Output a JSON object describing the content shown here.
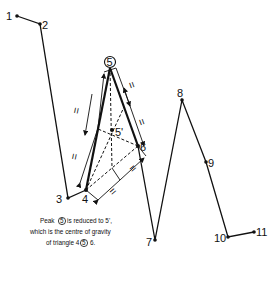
{
  "diagram": {
    "points": [
      {
        "id": "1",
        "label": "1"
      },
      {
        "id": "2",
        "label": "2"
      },
      {
        "id": "3",
        "label": "3"
      },
      {
        "id": "4",
        "label": "4"
      },
      {
        "id": "5",
        "label": "5",
        "circled": true
      },
      {
        "id": "5p",
        "label": "5'"
      },
      {
        "id": "6",
        "label": "6"
      },
      {
        "id": "7",
        "label": "7"
      },
      {
        "id": "8",
        "label": "8"
      },
      {
        "id": "9",
        "label": "9"
      },
      {
        "id": "10",
        "label": "10"
      },
      {
        "id": "11",
        "label": "11"
      }
    ],
    "polyline_order": [
      "1",
      "2",
      "3",
      "4",
      "5",
      "6",
      "7",
      "8",
      "9",
      "10",
      "11"
    ],
    "triangle": [
      "4",
      "5",
      "6"
    ],
    "centroid": "5p",
    "caption": {
      "line1_pre": "Peak",
      "line1_circled": "5",
      "line1_post": "is reduced to 5',",
      "line2": "which is the centre of gravity",
      "line3_pre": "of triangle 4",
      "line3_circled": "5",
      "line3_post": "6."
    },
    "equal_mark": "="
  }
}
